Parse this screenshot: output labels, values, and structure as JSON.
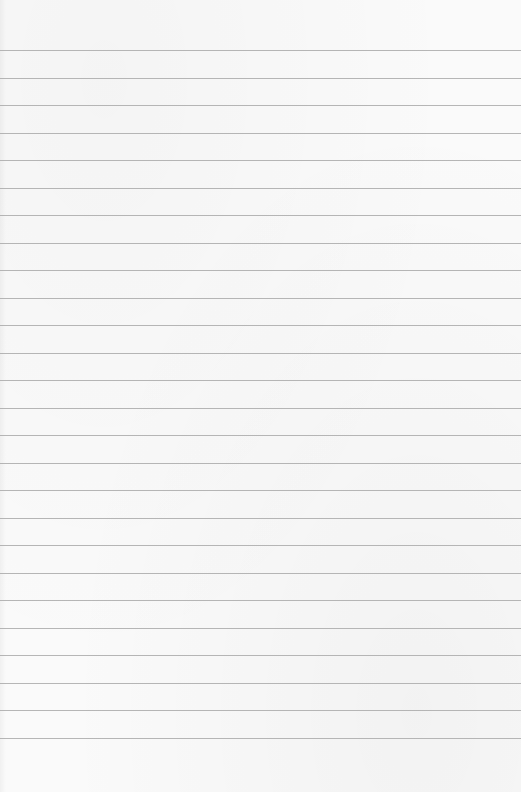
{
  "page": {
    "type": "lined-paper",
    "background_color": "#fafafa",
    "line_color": "#a9a9a9",
    "line_count": 26,
    "first_line_y": 50,
    "line_spacing": 27.5
  }
}
